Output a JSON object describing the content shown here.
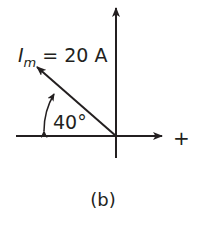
{
  "diagram": {
    "type": "phasor",
    "phasor_label": {
      "symbol": "I",
      "subscript": "m",
      "equals": " = ",
      "value": "20 A"
    },
    "angle_label": "40°",
    "angle_degrees": 40,
    "phasor_direction_degrees": 140,
    "positive_axis_label": "+",
    "caption": "(b)",
    "colors": {
      "stroke": "#231f20",
      "background": "#ffffff"
    }
  }
}
